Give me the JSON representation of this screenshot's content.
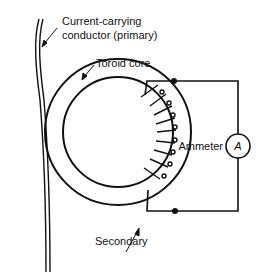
{
  "diagram": {
    "type": "current-transformer",
    "labels": {
      "primary_line1": "Current-carrying",
      "primary_line2": "conductor (primary)",
      "core": "Toroid core",
      "ammeter": "Ammeter",
      "ammeter_symbol": "A",
      "secondary": "Secondary"
    },
    "colors": {
      "stroke": "#111111",
      "background": "#ffffff"
    }
  }
}
